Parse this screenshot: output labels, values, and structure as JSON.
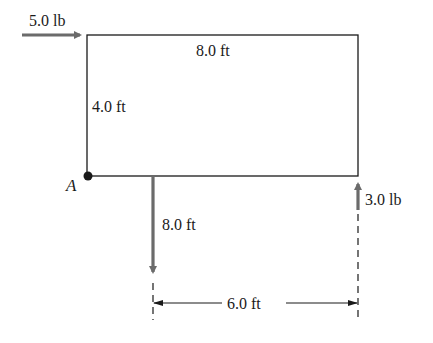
{
  "diagram": {
    "title": "",
    "point_label": "A",
    "forces": [
      {
        "id": "horizontal-force",
        "label": "5.0 lb",
        "direction": "right"
      },
      {
        "id": "downward-force",
        "label": "",
        "direction": "down"
      },
      {
        "id": "upward-force",
        "label": "3.0 lb",
        "direction": "up"
      }
    ],
    "dimensions": {
      "width_label": "8.0 ft",
      "height_label": "4.0 ft",
      "down_force_distance_label": "8.0 ft",
      "span_label": "6.0 ft"
    },
    "colors": {
      "line": "#1a1a1a",
      "force_arrow": "#6b6b6b",
      "background": "#ffffff"
    }
  }
}
